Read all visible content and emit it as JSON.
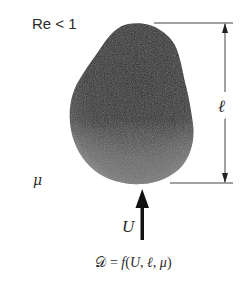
{
  "figure": {
    "regime_label": "Re < 1",
    "viscosity_symbol": "μ",
    "length_symbol": "ℓ",
    "velocity_symbol": "U",
    "formula": {
      "drag_symbol": "𝒟",
      "equals": " = ",
      "function_name": "f",
      "open_paren": "(",
      "arg1": "U",
      "sep1": ", ",
      "arg2": "ℓ",
      "sep2": ", ",
      "arg3": "μ",
      "close_paren": ")"
    },
    "colors": {
      "body_dark": "#2b2b2b",
      "body_light": "#7a7a7a",
      "lines": "#444444",
      "arrow": "#111111",
      "text": "#2a2a2a"
    }
  }
}
